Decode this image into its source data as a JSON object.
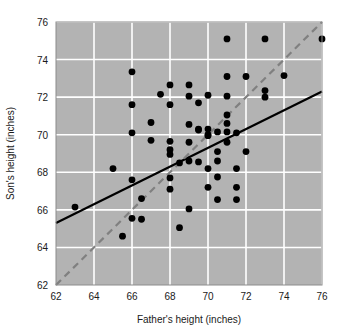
{
  "chart_data": {
    "type": "scatter",
    "title": "",
    "xlabel": "Father's height (inches)",
    "ylabel": "Son's height (inches)",
    "xlim": [
      62,
      76
    ],
    "ylim": [
      62,
      76
    ],
    "xticks": [
      62,
      64,
      66,
      68,
      70,
      72,
      74,
      76
    ],
    "yticks": [
      62,
      64,
      66,
      68,
      70,
      72,
      74,
      76
    ],
    "grid": true,
    "grid_color": "#ffffff",
    "plot_background": "#b3b3b3",
    "legend": "none",
    "point_color": "#000000",
    "point_size": 3.4,
    "x": [
      63.0,
      65.0,
      65.5,
      66.0,
      66.0,
      66.0,
      66.0,
      66.0,
      66.5,
      66.5,
      67.0,
      67.0,
      67.5,
      68.0,
      68.0,
      68.0,
      68.0,
      68.0,
      68.0,
      68.0,
      68.5,
      68.5,
      69.0,
      69.0,
      69.0,
      69.0,
      69.0,
      69.0,
      69.5,
      69.5,
      69.5,
      69.5,
      70.0,
      70.0,
      70.0,
      70.0,
      70.0,
      70.0,
      70.5,
      70.5,
      70.5,
      70.5,
      70.5,
      71.0,
      71.0,
      71.0,
      71.0,
      71.0,
      71.0,
      71.0,
      71.5,
      71.5,
      71.5,
      71.5,
      72.0,
      72.0,
      73.0,
      73.0,
      73.0,
      74.0,
      76.0
    ],
    "y": [
      66.15,
      68.2,
      64.6,
      73.35,
      71.6,
      70.1,
      67.6,
      65.55,
      66.6,
      65.5,
      70.65,
      69.7,
      72.15,
      72.65,
      71.6,
      69.65,
      69.2,
      68.95,
      67.7,
      67.1,
      68.5,
      65.05,
      72.65,
      72.05,
      70.55,
      69.6,
      68.6,
      66.05,
      71.7,
      70.3,
      70.25,
      68.55,
      72.1,
      70.3,
      70.0,
      69.95,
      68.2,
      67.2,
      70.15,
      69.1,
      68.6,
      67.75,
      66.55,
      75.1,
      73.1,
      72.05,
      71.05,
      70.6,
      70.15,
      69.6,
      70.1,
      68.2,
      67.2,
      66.55,
      73.1,
      69.1,
      75.1,
      72.35,
      72.0,
      73.15,
      75.1
    ],
    "lines": [
      {
        "name": "regression-line",
        "style": "solid",
        "color": "#000000",
        "width": 2.2,
        "x": [
          62,
          76
        ],
        "y": [
          65.3,
          72.3
        ]
      },
      {
        "name": "identity-line",
        "style": "dashed",
        "color": "#808080",
        "width": 2.2,
        "x": [
          62,
          76
        ],
        "y": [
          62,
          76
        ]
      }
    ]
  }
}
